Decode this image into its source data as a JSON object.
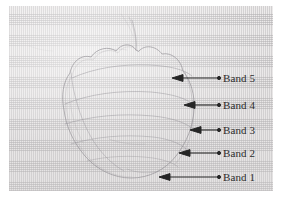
{
  "figure": {
    "type": "annotated-photograph",
    "background_color": "#eceaea",
    "page_color": "#ffffff",
    "ink_color": "#2c2c2c",
    "pencil_color": "#9a979c"
  },
  "annotations": [
    {
      "id": "band-5",
      "label": "Band 5",
      "label_x": 214,
      "label_y": 67,
      "arrow_tail_x": 210,
      "arrow_tail_y": 72,
      "arrow_head_x": 163,
      "arrow_head_y": 72
    },
    {
      "id": "band-4",
      "label": "Band 4",
      "label_x": 214,
      "label_y": 94,
      "arrow_tail_x": 210,
      "arrow_tail_y": 99,
      "arrow_head_x": 175,
      "arrow_head_y": 99
    },
    {
      "id": "band-3",
      "label": "Band 3",
      "label_x": 214,
      "label_y": 119,
      "arrow_tail_x": 210,
      "arrow_tail_y": 124,
      "arrow_head_x": 181,
      "arrow_head_y": 124
    },
    {
      "id": "band-2",
      "label": "Band 2",
      "label_x": 214,
      "label_y": 142,
      "arrow_tail_x": 210,
      "arrow_tail_y": 147,
      "arrow_head_x": 170,
      "arrow_head_y": 147
    },
    {
      "id": "band-1",
      "label": "Band 1",
      "label_x": 214,
      "label_y": 166,
      "arrow_tail_x": 210,
      "arrow_tail_y": 171,
      "arrow_head_x": 150,
      "arrow_head_y": 171
    }
  ]
}
